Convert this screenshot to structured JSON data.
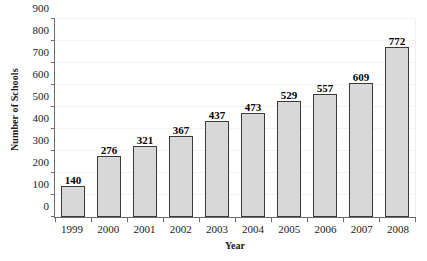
{
  "chart_data": {
    "type": "bar",
    "title": "",
    "xlabel": "Year",
    "ylabel": "Number of Schools",
    "categories": [
      "1999",
      "2000",
      "2001",
      "2002",
      "2003",
      "2004",
      "2005",
      "2006",
      "2007",
      "2008"
    ],
    "values": [
      140,
      276,
      321,
      367,
      437,
      473,
      529,
      557,
      609,
      772
    ],
    "value_labels": [
      "140",
      "276",
      "321",
      "367",
      "437",
      "473",
      "529",
      "557",
      "609",
      "772"
    ],
    "ylim": [
      0,
      900
    ],
    "ytick_values": [
      0,
      100,
      200,
      300,
      400,
      500,
      600,
      700,
      800,
      900
    ],
    "ytick_labels": [
      "0",
      "100",
      "200",
      "300",
      "400",
      "500",
      "600",
      "700",
      "800",
      "900"
    ],
    "grid": true,
    "legend": null,
    "bar_fill_color": "#d8d8d8",
    "bar_edge_color": "#3a3a3a",
    "axis_color": "#6b6b6b",
    "gridline_color": "#f2f2f2",
    "text_color": "#1a1a1a"
  },
  "title_remnant": ""
}
